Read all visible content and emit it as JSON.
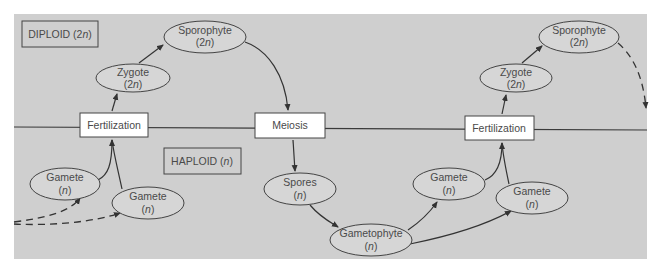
{
  "diagram": {
    "colors": {
      "panel": "#cfcfcf",
      "box_fill": "#ffffff",
      "stroke": "#3a3a3a",
      "ellipse_fill": "#d6d6d6",
      "text": "#4a4a4a"
    },
    "regions": {
      "diploid_label": "DIPLOID (2n)",
      "diploid_prefix": "DIPLOID (2",
      "diploid_italic": "n",
      "diploid_suffix": ")",
      "haploid_label": "HAPLOID (n)",
      "haploid_prefix": "HAPLOID (",
      "haploid_italic": "n",
      "haploid_suffix": ")"
    },
    "processes": {
      "fertilization_left": "Fertilization",
      "meiosis": "Meiosis",
      "fertilization_right": "Fertilization"
    },
    "stages": {
      "zygote_left": {
        "name": "Zygote",
        "ploidy_pre": "(2",
        "ploidy_n": "n",
        "ploidy_post": ")"
      },
      "sporophyte_left": {
        "name": "Sporophyte",
        "ploidy_pre": "(2",
        "ploidy_n": "n",
        "ploidy_post": ")"
      },
      "gamete_left_1": {
        "name": "Gamete",
        "ploidy_pre": "(",
        "ploidy_n": "n",
        "ploidy_post": ")"
      },
      "gamete_left_2": {
        "name": "Gamete",
        "ploidy_pre": "(",
        "ploidy_n": "n",
        "ploidy_post": ")"
      },
      "spores": {
        "name": "Spores",
        "ploidy_pre": "(",
        "ploidy_n": "n",
        "ploidy_post": ")"
      },
      "gametophyte": {
        "name": "Gametophyte",
        "ploidy_pre": "(",
        "ploidy_n": "n",
        "ploidy_post": ")"
      },
      "gamete_right_1": {
        "name": "Gamete",
        "ploidy_pre": "(",
        "ploidy_n": "n",
        "ploidy_post": ")"
      },
      "gamete_right_2": {
        "name": "Gamete",
        "ploidy_pre": "(",
        "ploidy_n": "n",
        "ploidy_post": ")"
      },
      "zygote_right": {
        "name": "Zygote",
        "ploidy_pre": "(2",
        "ploidy_n": "n",
        "ploidy_post": ")"
      },
      "sporophyte_right": {
        "name": "Sporophyte",
        "ploidy_pre": "(2",
        "ploidy_n": "n",
        "ploidy_post": ")"
      }
    }
  }
}
